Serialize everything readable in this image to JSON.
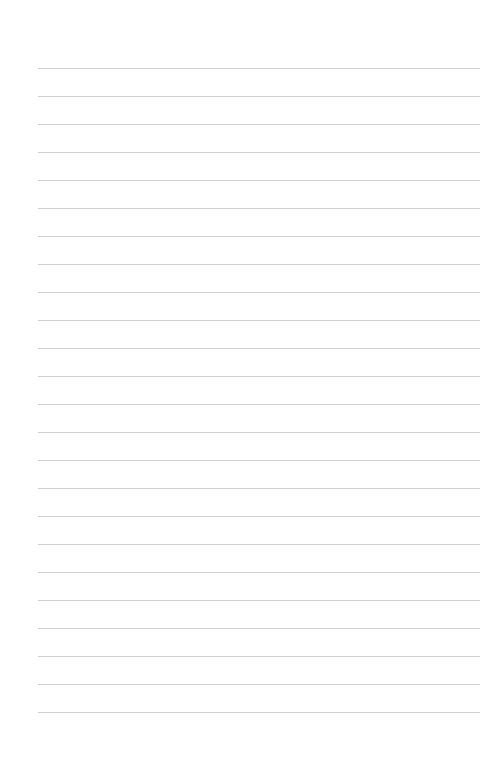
{
  "page": {
    "type": "blank-lined-paper",
    "line_count": 24,
    "first_line_y": 68,
    "line_spacing": 28,
    "line_left": 38,
    "line_right": 480,
    "line_color": "#cfcfcf",
    "background": "#ffffff"
  }
}
